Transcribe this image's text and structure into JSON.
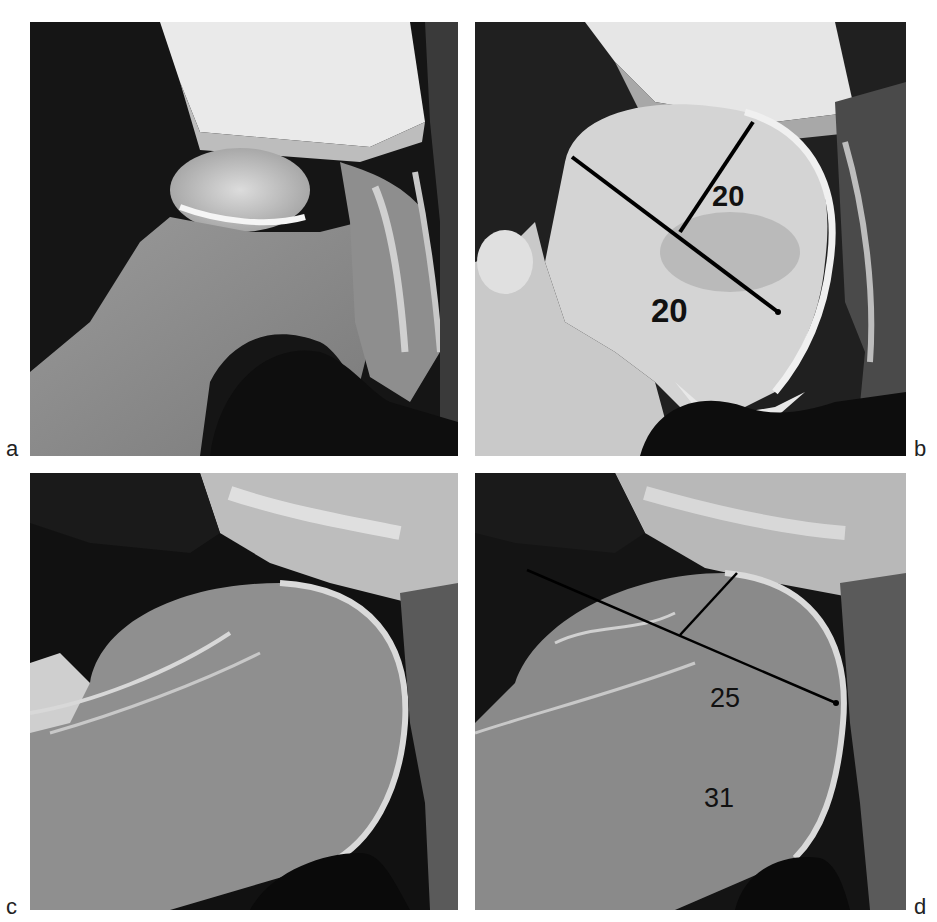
{
  "figure": {
    "panels": [
      {
        "id": "a",
        "label": "a",
        "description": "Radiograph of joint, unannotated"
      },
      {
        "id": "b",
        "label": "b",
        "description": "Radiograph with measurement lines",
        "measurements": [
          {
            "value": "20",
            "axis": "perpendicular"
          },
          {
            "value": "20",
            "axis": "diagonal"
          }
        ]
      },
      {
        "id": "c",
        "label": "c",
        "description": "Radiograph of joint, unannotated"
      },
      {
        "id": "d",
        "label": "d",
        "description": "Radiograph with measurement lines",
        "measurements": [
          {
            "value": "25",
            "axis": "perpendicular"
          },
          {
            "value": "31",
            "axis": "diagonal"
          }
        ]
      }
    ]
  }
}
